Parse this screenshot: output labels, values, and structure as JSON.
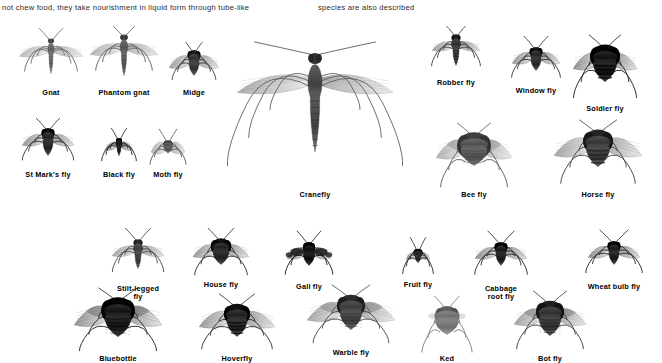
{
  "page": {
    "background_color": "#ffffff",
    "ink_color": "#000000"
  },
  "body_text": {
    "left_column": "not chew food, they take nourishment in liquid form through tube-like",
    "right_column": "species are also described"
  },
  "plate": {
    "title_implied": "Flies (Diptera) identification plate",
    "groups": [
      {
        "name": "upper-left-group",
        "specimens": [
          {
            "id": "gnat",
            "label": "Gnat",
            "x": 10,
            "y": 28,
            "w": 82,
            "h": 60,
            "body_len": 34,
            "body_w": 4,
            "wing_len": 32,
            "wing_w": 9,
            "tone": "#7a7a7a",
            "style": "slender"
          },
          {
            "id": "phantom-gnat",
            "label": "Phantom gnat",
            "x": 80,
            "y": 26,
            "w": 88,
            "h": 62,
            "body_len": 40,
            "body_w": 5,
            "wing_len": 34,
            "wing_w": 10,
            "tone": "#6e6e6e",
            "style": "slender"
          },
          {
            "id": "midge",
            "label": "Midge",
            "x": 160,
            "y": 42,
            "w": 68,
            "h": 46,
            "body_len": 24,
            "body_w": 7,
            "wing_len": 25,
            "wing_w": 11,
            "tone": "#4a4a4a",
            "style": "stout"
          },
          {
            "id": "st-marks-fly",
            "label": "St Mark's fly",
            "x": 8,
            "y": 118,
            "w": 80,
            "h": 52,
            "body_len": 26,
            "body_w": 7,
            "wing_len": 26,
            "wing_w": 10,
            "tone": "#3c3c3c",
            "style": "stout"
          },
          {
            "id": "black-fly",
            "label": "Black fly",
            "x": 92,
            "y": 128,
            "w": 54,
            "h": 42,
            "body_len": 17,
            "body_w": 4,
            "wing_len": 14,
            "wing_w": 7,
            "tone": "#2e2e2e",
            "style": "tiny"
          },
          {
            "id": "moth-fly",
            "label": "Moth fly",
            "x": 140,
            "y": 128,
            "w": 56,
            "h": 42,
            "body_len": 12,
            "body_w": 6,
            "wing_len": 17,
            "wing_w": 13,
            "tone": "#6a6a6a",
            "style": "mothlike"
          },
          {
            "id": "cranefly",
            "label": "Cranefly",
            "x": 226,
            "y": 18,
            "w": 178,
            "h": 172,
            "body_len": 96,
            "body_w": 9,
            "wing_len": 78,
            "wing_w": 16,
            "tone": "#5c5c5c",
            "style": "cranefly"
          }
        ]
      },
      {
        "name": "upper-right-group",
        "specimens": [
          {
            "id": "robber-fly",
            "label": "Robber fly",
            "x": 418,
            "y": 26,
            "w": 76,
            "h": 52,
            "body_len": 30,
            "body_w": 6,
            "wing_len": 24,
            "wing_w": 8,
            "tone": "#4a4a4a",
            "style": "slender"
          },
          {
            "id": "window-fly",
            "label": "Window fly",
            "x": 498,
            "y": 36,
            "w": 76,
            "h": 50,
            "body_len": 22,
            "body_w": 7,
            "wing_len": 24,
            "wing_w": 10,
            "tone": "#3f3f3f",
            "style": "stout"
          },
          {
            "id": "soldier-fly",
            "label": "Soldier fly",
            "x": 556,
            "y": 28,
            "w": 98,
            "h": 76,
            "body_len": 34,
            "body_w": 16,
            "wing_len": 32,
            "wing_w": 14,
            "tone": "#2b2b2b",
            "style": "banded"
          },
          {
            "id": "bee-fly",
            "label": "Bee fly",
            "x": 422,
            "y": 114,
            "w": 104,
            "h": 76,
            "body_len": 30,
            "body_w": 18,
            "wing_len": 38,
            "wing_w": 16,
            "tone": "#6a6a6a",
            "style": "hairy"
          },
          {
            "id": "horse-fly",
            "label": "Horse fly",
            "x": 540,
            "y": 112,
            "w": 116,
            "h": 78,
            "body_len": 34,
            "body_w": 16,
            "wing_len": 44,
            "wing_w": 16,
            "tone": "#4f4f4f",
            "style": "banded"
          }
        ]
      },
      {
        "name": "lower-group",
        "specimens": [
          {
            "id": "stilt-legged-fly",
            "label": "Stilt-legged\nfly",
            "x": 98,
            "y": 228,
            "w": 80,
            "h": 56,
            "body_len": 28,
            "body_w": 6,
            "wing_len": 26,
            "wing_w": 9,
            "tone": "#555555",
            "style": "slender"
          },
          {
            "id": "house-fly",
            "label": "House fly",
            "x": 180,
            "y": 228,
            "w": 82,
            "h": 52,
            "body_len": 24,
            "body_w": 11,
            "wing_len": 28,
            "wing_w": 11,
            "tone": "#3a3a3a",
            "style": "stout"
          },
          {
            "id": "gall-fly",
            "label": "Gall fly",
            "x": 272,
            "y": 230,
            "w": 74,
            "h": 52,
            "body_len": 22,
            "body_w": 8,
            "wing_len": 22,
            "wing_w": 10,
            "tone": "#262626",
            "style": "spotwing"
          },
          {
            "id": "fruit-fly",
            "label": "Fruit fly",
            "x": 394,
            "y": 236,
            "w": 48,
            "h": 44,
            "body_len": 13,
            "body_w": 6,
            "wing_len": 12,
            "wing_w": 6,
            "tone": "#3a3a3a",
            "style": "tiny"
          },
          {
            "id": "cabbage-root-fly",
            "label": "Cabbage\nroot fly",
            "x": 460,
            "y": 228,
            "w": 82,
            "h": 56,
            "body_len": 22,
            "body_w": 7,
            "wing_len": 26,
            "wing_w": 10,
            "tone": "#333333",
            "style": "stout"
          },
          {
            "id": "wheat-bulb-fly",
            "label": "Wheat bulb fly",
            "x": 570,
            "y": 228,
            "w": 88,
            "h": 54,
            "body_len": 22,
            "body_w": 7,
            "wing_len": 26,
            "wing_w": 10,
            "tone": "#333333",
            "style": "stout"
          },
          {
            "id": "bluebottle",
            "label": "Bluebottle",
            "x": 58,
            "y": 286,
            "w": 120,
            "h": 68,
            "body_len": 36,
            "body_w": 18,
            "wing_len": 44,
            "wing_w": 17,
            "tone": "#2e2e2e",
            "style": "hairy"
          },
          {
            "id": "hoverfly",
            "label": "Hoverfly",
            "x": 182,
            "y": 292,
            "w": 110,
            "h": 62,
            "body_len": 30,
            "body_w": 14,
            "wing_len": 38,
            "wing_w": 14,
            "tone": "#3a3a3a",
            "style": "banded"
          },
          {
            "id": "warble-fly",
            "label": "Warble fly",
            "x": 292,
            "y": 282,
            "w": 118,
            "h": 66,
            "body_len": 32,
            "body_w": 15,
            "wing_len": 44,
            "wing_w": 16,
            "tone": "#565656",
            "style": "hairy"
          },
          {
            "id": "ked",
            "label": "Ked",
            "x": 408,
            "y": 292,
            "w": 78,
            "h": 62,
            "body_len": 26,
            "body_w": 16,
            "wing_len": 10,
            "wing_w": 6,
            "tone": "#8a8a8a",
            "style": "wingless"
          },
          {
            "id": "bot-fly",
            "label": "Bot fly",
            "x": 498,
            "y": 288,
            "w": 104,
            "h": 66,
            "body_len": 32,
            "body_w": 15,
            "wing_len": 36,
            "wing_w": 14,
            "tone": "#4a4a4a",
            "style": "hairy"
          }
        ]
      }
    ]
  }
}
